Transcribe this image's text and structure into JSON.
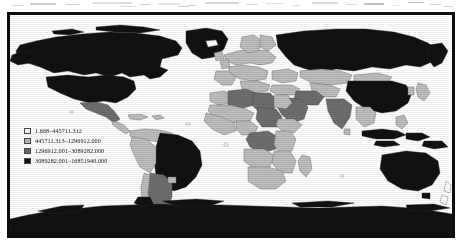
{
  "figure": {
    "type": "choropleth-world-map",
    "projection": "equirectangular",
    "frame_color": "#0d0d0d",
    "background_color": "#ffffff",
    "ocean_color": "#ffffff"
  },
  "legend": {
    "position": "lower-left",
    "classes": [
      {
        "swatch_color": "#f4f4f4",
        "label": "1.668–445711.312"
      },
      {
        "swatch_color": "#b9b9b9",
        "label": "445711.313–1296912.000"
      },
      {
        "swatch_color": "#6b6b6b",
        "label": "1296912.001–3089282.000"
      },
      {
        "swatch_color": "#111111",
        "label": "3089282.001–16851940.000"
      }
    ]
  },
  "chart_data": {
    "type": "map",
    "title": "",
    "classes": [
      {
        "index": 0,
        "range_min": 1.668,
        "range_max": 445711.312,
        "color": "#f4f4f4"
      },
      {
        "index": 1,
        "range_min": 445711.313,
        "range_max": 1296912.0,
        "color": "#b9b9b9"
      },
      {
        "index": 2,
        "range_min": 1296912.001,
        "range_max": 3089282.0,
        "color": "#6b6b6b"
      },
      {
        "index": 3,
        "range_min": 3089282.001,
        "range_max": 16851940.0,
        "color": "#111111"
      }
    ],
    "regions": [
      {
        "name": "Canada",
        "class": 3
      },
      {
        "name": "United States",
        "class": 3
      },
      {
        "name": "Greenland",
        "class": 3
      },
      {
        "name": "Alaska",
        "class": 3
      },
      {
        "name": "Mexico",
        "class": 2
      },
      {
        "name": "Brazil",
        "class": 3
      },
      {
        "name": "Argentina",
        "class": 2
      },
      {
        "name": "Chile",
        "class": 1
      },
      {
        "name": "Peru",
        "class": 1
      },
      {
        "name": "Colombia",
        "class": 1
      },
      {
        "name": "Venezuela",
        "class": 1
      },
      {
        "name": "Bolivia",
        "class": 1
      },
      {
        "name": "Western Europe",
        "class": 1
      },
      {
        "name": "Russia",
        "class": 3
      },
      {
        "name": "Kazakhstan",
        "class": 2
      },
      {
        "name": "Mongolia",
        "class": 1
      },
      {
        "name": "China",
        "class": 3
      },
      {
        "name": "India",
        "class": 2
      },
      {
        "name": "Saudi Arabia",
        "class": 2
      },
      {
        "name": "Iran",
        "class": 2
      },
      {
        "name": "Algeria",
        "class": 2
      },
      {
        "name": "Libya",
        "class": 2
      },
      {
        "name": "Egypt",
        "class": 1
      },
      {
        "name": "Sudan",
        "class": 2
      },
      {
        "name": "DR Congo",
        "class": 2
      },
      {
        "name": "Sub-Saharan Africa",
        "class": 1
      },
      {
        "name": "Indonesia",
        "class": 3
      },
      {
        "name": "Australia",
        "class": 3
      },
      {
        "name": "New Zealand",
        "class": 0
      },
      {
        "name": "Antarctica",
        "class": 3
      }
    ],
    "legend_position": "lower-left",
    "grid": false
  }
}
